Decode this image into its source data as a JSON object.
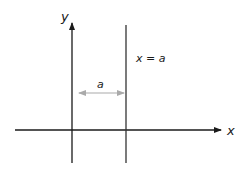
{
  "diagram": {
    "type": "coordinate-axes",
    "y_axis_label": "y",
    "x_axis_label": "x",
    "line_label": "x = a",
    "distance_label": "a",
    "colors": {
      "axis": "#1a1a1a",
      "line": "#333333",
      "distance_arrow": "#aaaaaa"
    }
  }
}
